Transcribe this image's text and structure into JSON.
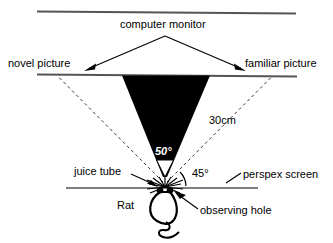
{
  "figure": {
    "labels": {
      "computer_monitor": "computer monitor",
      "novel_picture": "novel picture",
      "familiar_picture": "familiar picture",
      "distance_30cm": "30cm",
      "angle_50": "50°",
      "angle_45": "45°",
      "juice_tube": "juice tube",
      "perspex_screen": "perspex screen",
      "rat": "Rat",
      "observing_hole": "observing hole"
    },
    "colors": {
      "stroke": "#000000",
      "background": "#ffffff",
      "cone_fill": "#000000",
      "monitor_line": "#555555",
      "screen_line": "#555555"
    },
    "icons": {
      "rat": "rat-icon",
      "viewing_cone": "viewing-cone-icon",
      "observing_hole": "observing-hole-icon"
    },
    "geometry": {
      "monitor_line": {
        "x1": 37,
        "y1": 11,
        "x2": 296,
        "y2": 13
      },
      "picture_plane_line": {
        "x1": 37,
        "y1": 74,
        "x2": 297,
        "y2": 76
      },
      "perspex_line": {
        "x1": 66,
        "y1": 188,
        "x2": 258,
        "y2": 188
      },
      "cone_apex": {
        "x": 165,
        "y": 177
      },
      "cone_top_left": {
        "x": 122,
        "y": 75
      },
      "cone_top_right": {
        "x": 210,
        "y": 75
      },
      "sight_line_left_end": {
        "x": 58,
        "y": 76
      },
      "sight_line_right_end": {
        "x": 272,
        "y": 76
      }
    }
  }
}
